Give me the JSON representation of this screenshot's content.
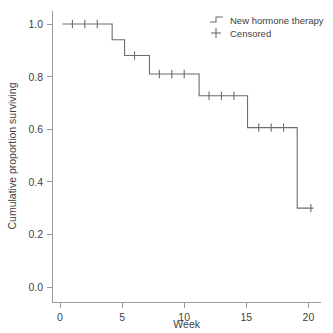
{
  "chart_data": {
    "type": "line",
    "subtype": "kaplan-meier-step",
    "title": "",
    "xlabel": "Week",
    "ylabel": "Cumulative proportion surviving",
    "xlim": [
      -0.6,
      21.0
    ],
    "ylim": [
      -0.06,
      1.04
    ],
    "xticks": [
      0,
      5,
      10,
      15,
      20
    ],
    "xticklabels": [
      "0",
      "5",
      "10",
      "15",
      "20"
    ],
    "yticks": [
      0.0,
      0.2,
      0.4,
      0.6,
      0.8,
      1.0
    ],
    "yticklabels": [
      "0.0",
      "0.2",
      "0.4",
      "0.6",
      "0.8",
      "1.0"
    ],
    "grid": false,
    "legend_position": "top-right",
    "series": [
      {
        "name": "New hormone therapy",
        "marker": "step-line",
        "color": "#6d6d6d",
        "steps": [
          {
            "x_start": 0.2,
            "x_end": 4.2,
            "y": 1.0
          },
          {
            "x_start": 4.2,
            "x_end": 5.2,
            "y": 0.94
          },
          {
            "x_start": 5.2,
            "x_end": 7.2,
            "y": 0.88
          },
          {
            "x_start": 7.2,
            "x_end": 11.2,
            "y": 0.81
          },
          {
            "x_start": 11.2,
            "x_end": 15.1,
            "y": 0.727
          },
          {
            "x_start": 15.1,
            "x_end": 19.1,
            "y": 0.606
          },
          {
            "x_start": 19.1,
            "x_end": 20.4,
            "y": 0.3
          }
        ],
        "x": [
          0.2,
          4.2,
          4.2,
          5.2,
          5.2,
          7.2,
          7.2,
          11.2,
          11.2,
          15.1,
          15.1,
          19.1,
          19.1,
          20.4
        ],
        "y": [
          1.0,
          1.0,
          0.94,
          0.94,
          0.88,
          0.88,
          0.81,
          0.81,
          0.727,
          0.727,
          0.606,
          0.606,
          0.3,
          0.3
        ]
      },
      {
        "name": "Censored",
        "marker": "plus",
        "color": "#6d6d6d",
        "points": [
          {
            "x": 1.0,
            "y": 1.0
          },
          {
            "x": 2.0,
            "y": 1.0
          },
          {
            "x": 3.0,
            "y": 1.0
          },
          {
            "x": 6.0,
            "y": 0.88
          },
          {
            "x": 8.0,
            "y": 0.81
          },
          {
            "x": 9.0,
            "y": 0.81
          },
          {
            "x": 10.0,
            "y": 0.81
          },
          {
            "x": 12.0,
            "y": 0.727
          },
          {
            "x": 13.0,
            "y": 0.727
          },
          {
            "x": 14.0,
            "y": 0.727
          },
          {
            "x": 16.0,
            "y": 0.606
          },
          {
            "x": 17.0,
            "y": 0.606
          },
          {
            "x": 18.0,
            "y": 0.606
          },
          {
            "x": 20.2,
            "y": 0.3
          }
        ]
      }
    ]
  },
  "legend": {
    "entries": [
      {
        "label": "New hormone therapy",
        "glyph": "step-line-icon"
      },
      {
        "label": "Censored",
        "glyph": "plus-icon"
      }
    ]
  },
  "colors": {
    "background": "#ffffff",
    "axis": "#9a9a9a",
    "curve": "#6d6d6d",
    "text": "#3f3f3f"
  }
}
